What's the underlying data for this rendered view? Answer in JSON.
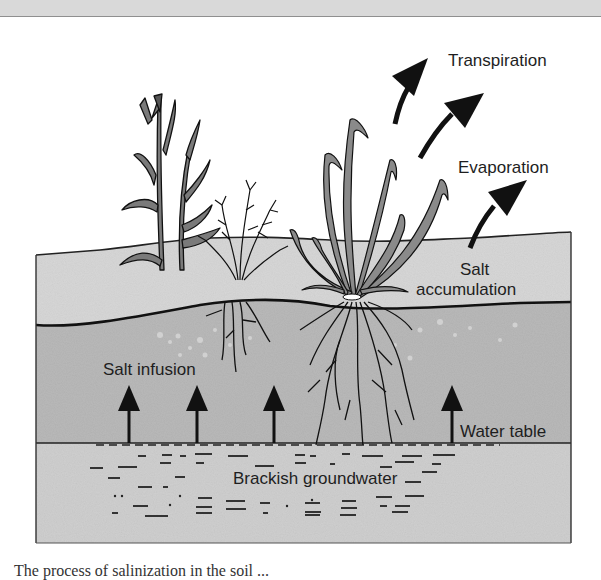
{
  "diagram": {
    "labels": {
      "transpiration": "Transpiration",
      "evaporation": "Evaporation",
      "salt_accumulation_line1": "Salt",
      "salt_accumulation_line2": "accumulation",
      "salt_infusion": "Salt infusion",
      "water_table": "Water table",
      "brackish_groundwater": "Brackish groundwater"
    },
    "layers": [
      {
        "name": "surface soil (salt accumulation zone)",
        "color": "#d6d6d6"
      },
      {
        "name": "root zone (salt infusion)",
        "color": "#b8b8b8"
      },
      {
        "name": "brackish groundwater",
        "color": "#cfcfcf"
      }
    ],
    "arrows": {
      "upward_salt_infusion_count": 5,
      "transpiration_count": 2,
      "evaporation_count": 1
    },
    "colors": {
      "ink": "#111111",
      "background": "#ffffff",
      "header_band": "#d9d9d9"
    }
  },
  "caption": {
    "text": "The process of salinization in the soil ..."
  }
}
